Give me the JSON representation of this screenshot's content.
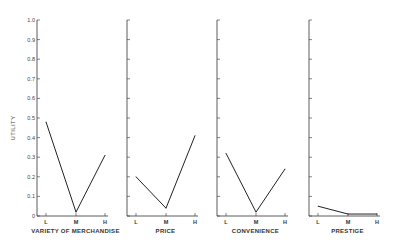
{
  "chart_data": [
    {
      "type": "line",
      "title": "",
      "xlabel": "VARIETY OF MERCHANDISE",
      "ylabel": "UTILITY",
      "categories": [
        "L",
        "M",
        "H"
      ],
      "values": [
        0.48,
        0.02,
        0.31
      ],
      "ylim": [
        0,
        1.0
      ],
      "yticks": [
        "0",
        "0.1",
        "0.2",
        "0.3",
        "0.4",
        "0.5",
        "0.6",
        "0.7",
        "0.8",
        "0.9",
        "1.0"
      ],
      "grid": false
    },
    {
      "type": "line",
      "title": "",
      "xlabel": "PRICE",
      "ylabel": "",
      "categories": [
        "L",
        "M",
        "H"
      ],
      "values": [
        0.2,
        0.04,
        0.41
      ],
      "ylim": [
        0,
        1.0
      ],
      "grid": false
    },
    {
      "type": "line",
      "title": "",
      "xlabel": "CONVENIENCE",
      "ylabel": "",
      "categories": [
        "L",
        "M",
        "H"
      ],
      "values": [
        0.32,
        0.02,
        0.24
      ],
      "ylim": [
        0,
        1.0
      ],
      "grid": false
    },
    {
      "type": "line",
      "title": "",
      "xlabel": "PRESTIGE",
      "ylabel": "",
      "categories": [
        "L",
        "M",
        "H"
      ],
      "values": [
        0.05,
        0.01,
        0.01
      ],
      "ylim": [
        0,
        1.0
      ],
      "grid": false
    }
  ]
}
